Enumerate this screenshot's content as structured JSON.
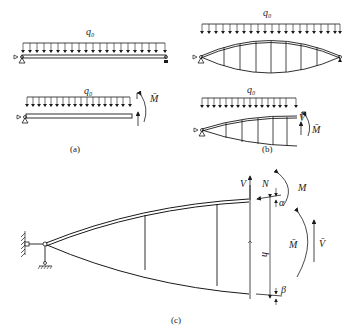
{
  "figure": {
    "panel_a": {
      "caption": "(a)",
      "top": {
        "load_label": "q₀",
        "left_support": "pin",
        "right_support": "roller"
      },
      "bottom": {
        "load_label": "q₀",
        "moment_label": "M̄",
        "left_support": "pin"
      }
    },
    "panel_b": {
      "caption": "(b)",
      "top": {
        "load_label": "q₀",
        "shape": "lenticular truss"
      },
      "bottom": {
        "load_label": "q₀",
        "shear_label": "V̄",
        "moment_label": "M̄"
      }
    },
    "panel_c": {
      "caption": "(c)",
      "labels": {
        "V": "V",
        "N": "N",
        "M": "M",
        "alpha": "α",
        "beta": "β",
        "h": "h",
        "M_bar": "M̄",
        "V_bar": "V̄"
      }
    }
  }
}
